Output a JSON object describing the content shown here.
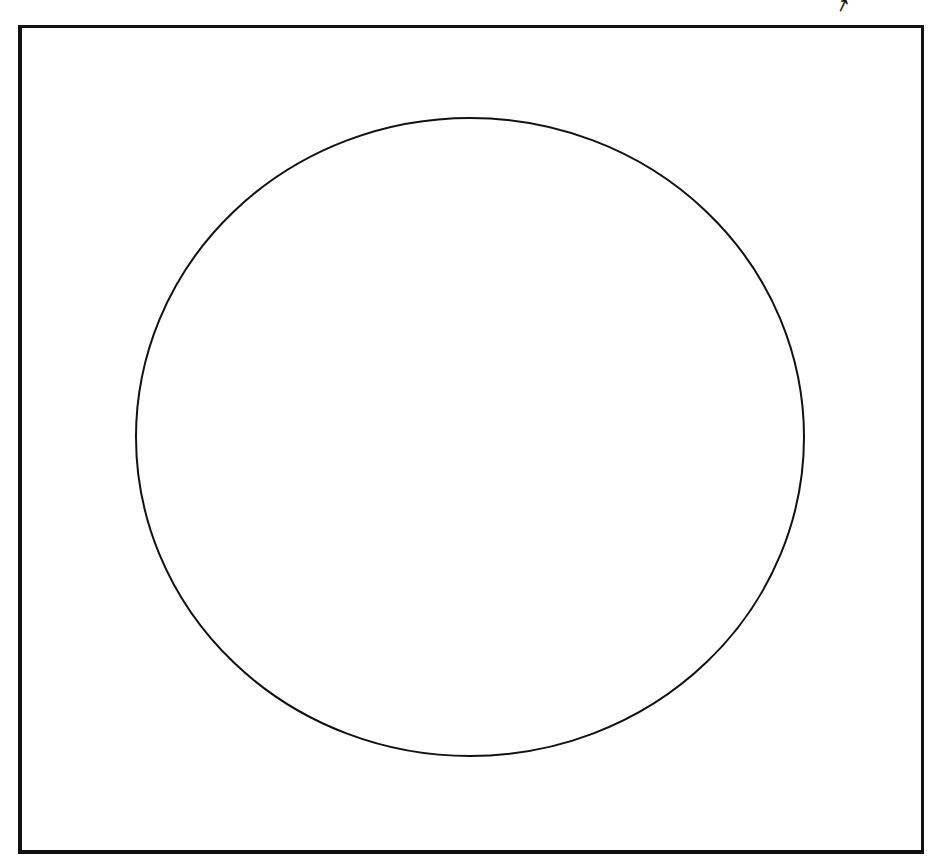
{
  "diagram": {
    "frame": {
      "left": 18,
      "top": 25,
      "right": 921,
      "bottom": 851,
      "stroke": "#111111"
    },
    "circle": {
      "cx": 470,
      "cy": 437,
      "rx": 334,
      "ry": 319,
      "stroke": "#111111",
      "fill": "#ffffff"
    },
    "corner_mark": "↗"
  }
}
